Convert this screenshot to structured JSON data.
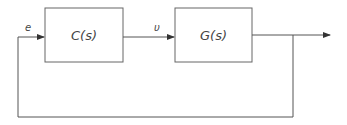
{
  "diagram": {
    "type": "feedback-control-loop",
    "blocks": [
      {
        "id": "controller",
        "label": "C(s)"
      },
      {
        "id": "plant",
        "label": "G(s)"
      }
    ],
    "signals": [
      {
        "id": "error",
        "label": "e"
      },
      {
        "id": "control",
        "label": "υ"
      }
    ],
    "colors": {
      "stroke": "#555555",
      "text": "#444444",
      "background": "#ffffff"
    }
  }
}
